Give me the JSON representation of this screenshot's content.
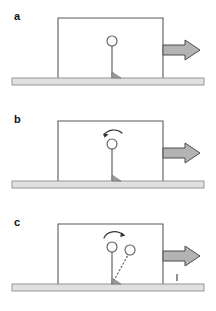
{
  "figure": {
    "panels": [
      {
        "id": "a",
        "label": "a",
        "caption": "cart accelerated to the right, pendulum upright",
        "elements": {
          "cart_body": "cart-outline",
          "pendulum_rod": "vertical-rod",
          "pendulum_bob": "circle-bob",
          "pivot": "hinge-pivot",
          "force_arrow": "right-block-arrow",
          "ground": "ground-bar"
        },
        "has_rotation_arrow": false,
        "has_displaced_pendulum": false,
        "has_tick_mark": false
      },
      {
        "id": "b",
        "label": "b",
        "caption": "rotation begins, curved arrow over the bob",
        "elements": {
          "cart_body": "cart-outline",
          "pendulum_rod": "vertical-rod",
          "pendulum_bob": "circle-bob",
          "pivot": "hinge-pivot",
          "force_arrow": "right-block-arrow",
          "ground": "ground-bar",
          "rotation_arrow": "curved-ccw-arrow"
        },
        "has_rotation_arrow": true,
        "has_displaced_pendulum": false,
        "has_tick_mark": false
      },
      {
        "id": "c",
        "label": "c",
        "caption": "pendulum swung to displaced dotted position",
        "elements": {
          "cart_body": "cart-outline",
          "pendulum_rod": "vertical-rod",
          "pendulum_bob": "circle-bob",
          "pivot": "hinge-pivot",
          "force_arrow": "right-block-arrow",
          "ground": "ground-bar",
          "rotation_arrow": "curved-ccw-arrow",
          "displaced_rod": "dotted-rod",
          "displaced_bob": "circle-bob-displaced",
          "tick_mark": "small-vertical-tick"
        },
        "has_rotation_arrow": true,
        "has_displaced_pendulum": true,
        "has_tick_mark": true
      }
    ],
    "geometry": {
      "cart_left": 58,
      "cart_right": 163,
      "cart_top": 18,
      "cart_bottom": 78,
      "pivot_x": 112,
      "pivot_y": 78,
      "bob_cx": 112,
      "bob_cy": 41,
      "bob_r": 5,
      "displaced_bob_cx": 130,
      "displaced_bob_cy": 44,
      "ground_left": 12,
      "ground_right": 204,
      "ground_top": 78,
      "ground_height": 7,
      "arrow_tail_x": 163,
      "arrow_tip_x": 200,
      "arrow_mid_y": 50,
      "tick_x": 177,
      "tick_y": 72
    },
    "colors": {
      "stroke": "#595959",
      "stroke_dark": "#333333",
      "arrow_fill": "#b3b3b3",
      "arrow_stroke": "#4d4d4d",
      "ground_fill": "#e0e0e0",
      "ground_stroke": "#8c8c8c",
      "bob_fill": "#ffffff",
      "background": "#ffffff",
      "label_color": "#111111"
    }
  }
}
